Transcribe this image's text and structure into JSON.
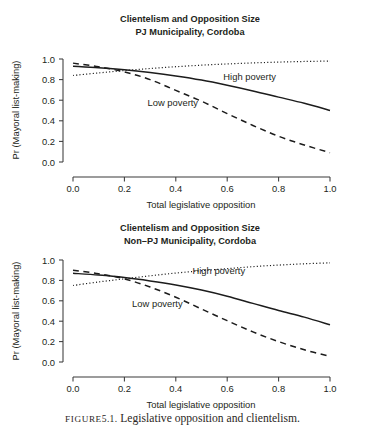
{
  "figure": {
    "caption_prefix": "FIGURE",
    "caption_number": "5.1.",
    "caption_text": "Legislative opposition and clientelism."
  },
  "chart_data": [
    {
      "type": "line",
      "panel_id": "pj",
      "title": "Clientelism and Opposition Size",
      "subtitle": "PJ Municipality, Cordoba",
      "xlabel": "Total legislative opposition",
      "ylabel": "Pr (Mayoral list-making)",
      "xlim": [
        0,
        1
      ],
      "ylim": [
        0,
        1
      ],
      "xticks": [
        0,
        0.2,
        0.4,
        0.6,
        0.8,
        1
      ],
      "xticklabels": [
        "0.0",
        "0.2",
        "0.4",
        "0.6",
        "0.8",
        "1.0"
      ],
      "yticks": [
        0,
        0.2,
        0.4,
        0.6,
        0.8,
        1
      ],
      "yticklabels": [
        "0.0",
        "0.2",
        "0.4",
        "0.6",
        "0.8",
        "1.0"
      ],
      "grid": false,
      "legend_position": "in-plot annotations",
      "series": [
        {
          "name": "High poverty",
          "style": "dotted",
          "label": "High poverty",
          "x": [
            0,
            0.1,
            0.2,
            0.3,
            0.4,
            0.5,
            0.6,
            0.7,
            0.8,
            0.9,
            1
          ],
          "values": [
            0.84,
            0.865,
            0.888,
            0.908,
            0.925,
            0.94,
            0.952,
            0.962,
            0.97,
            0.976,
            0.98
          ]
        },
        {
          "name": "Medium / pooled",
          "style": "solid",
          "label": "",
          "x": [
            0,
            0.1,
            0.2,
            0.3,
            0.4,
            0.5,
            0.6,
            0.7,
            0.8,
            0.9,
            1
          ],
          "values": [
            0.93,
            0.915,
            0.895,
            0.868,
            0.835,
            0.795,
            0.745,
            0.69,
            0.63,
            0.57,
            0.5
          ]
        },
        {
          "name": "Low poverty",
          "style": "dashed",
          "label": "Low poverty",
          "x": [
            0,
            0.1,
            0.2,
            0.3,
            0.4,
            0.5,
            0.6,
            0.7,
            0.8,
            0.9,
            1
          ],
          "values": [
            0.96,
            0.925,
            0.875,
            0.8,
            0.695,
            0.59,
            0.47,
            0.355,
            0.25,
            0.165,
            0.09
          ]
        }
      ],
      "annotations": [
        {
          "text": "High poverty",
          "x": 0.585,
          "y": 0.8,
          "name": "high-poverty-label"
        },
        {
          "text": "Low poverty",
          "x": 0.29,
          "y": 0.545,
          "name": "low-poverty-label"
        }
      ]
    },
    {
      "type": "line",
      "panel_id": "nonpj",
      "title": "Clientelism and Opposition Size",
      "subtitle": "Non–PJ Municipality, Cordoba",
      "xlabel": "Total legislative opposition",
      "ylabel": "Pr (Mayoral list-making)",
      "xlim": [
        0,
        1
      ],
      "ylim": [
        0,
        1
      ],
      "xticks": [
        0,
        0.2,
        0.4,
        0.6,
        0.8,
        1
      ],
      "xticklabels": [
        "0.0",
        "0.2",
        "0.4",
        "0.6",
        "0.8",
        "1.0"
      ],
      "yticks": [
        0,
        0.2,
        0.4,
        0.6,
        0.8,
        1
      ],
      "yticklabels": [
        "0.0",
        "0.2",
        "0.4",
        "0.6",
        "0.8",
        "1.0"
      ],
      "grid": false,
      "legend_position": "in-plot annotations",
      "series": [
        {
          "name": "High poverty",
          "style": "dotted",
          "label": "High poverty",
          "x": [
            0,
            0.1,
            0.2,
            0.3,
            0.4,
            0.5,
            0.6,
            0.7,
            0.8,
            0.9,
            1
          ],
          "values": [
            0.75,
            0.785,
            0.815,
            0.845,
            0.872,
            0.895,
            0.915,
            0.935,
            0.95,
            0.963,
            0.972
          ]
        },
        {
          "name": "Medium / pooled",
          "style": "solid",
          "label": "",
          "x": [
            0,
            0.1,
            0.2,
            0.3,
            0.4,
            0.5,
            0.6,
            0.7,
            0.8,
            0.9,
            1
          ],
          "values": [
            0.87,
            0.852,
            0.828,
            0.795,
            0.755,
            0.705,
            0.645,
            0.575,
            0.505,
            0.44,
            0.365
          ]
        },
        {
          "name": "Low poverty",
          "style": "dashed",
          "label": "Low poverty",
          "x": [
            0,
            0.1,
            0.2,
            0.3,
            0.4,
            0.5,
            0.6,
            0.7,
            0.8,
            0.9,
            1
          ],
          "values": [
            0.9,
            0.865,
            0.815,
            0.735,
            0.635,
            0.52,
            0.405,
            0.295,
            0.2,
            0.12,
            0.055
          ]
        }
      ],
      "annotations": [
        {
          "text": "High poverty",
          "x": 0.465,
          "y": 0.86,
          "name": "high-poverty-label"
        },
        {
          "text": "Low poverty",
          "x": 0.23,
          "y": 0.54,
          "name": "low-poverty-label"
        }
      ]
    }
  ]
}
